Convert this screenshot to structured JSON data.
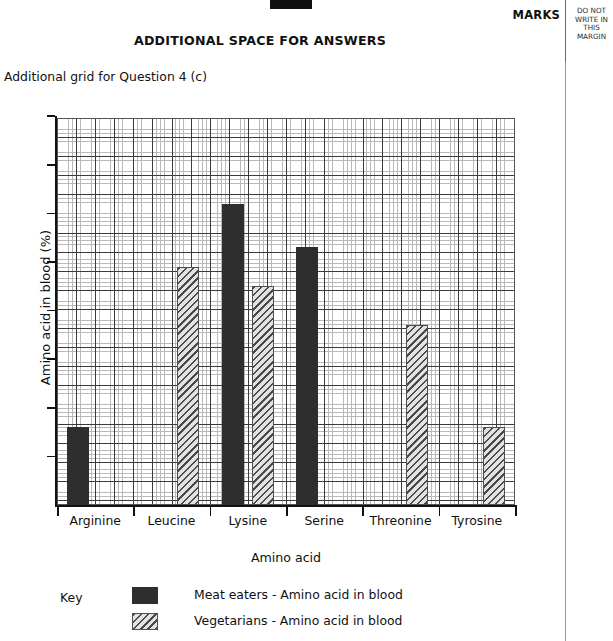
{
  "page": {
    "marks_label": "MARKS",
    "margin_note_lines": [
      "DO NOT",
      "WRITE IN",
      "THIS",
      "MARGIN"
    ],
    "title": "ADDITIONAL SPACE FOR ANSWERS",
    "subtitle": "Additional grid for Question 4 (c)"
  },
  "key": {
    "title": "Key",
    "entries": [
      {
        "label": "Meat eaters - Amino acid in blood",
        "style": "solid"
      },
      {
        "label": "Vegetarians - Amino acid in blood",
        "style": "hatch"
      }
    ]
  },
  "chart_data": {
    "type": "bar",
    "title": "",
    "xlabel": "Amino acid",
    "ylabel": "Amino acid in blood (%)",
    "grid": true,
    "grid_style": "graph-paper, major gridline every 5 small squares",
    "legend_position": "below-plot",
    "axis_tick_labels_shown": false,
    "y_major_gridline_count": 8,
    "ylim": [
      0,
      8
    ],
    "categories": [
      "Arginine",
      "Leucine",
      "Lysine",
      "Serine",
      "Threonine",
      "Tyrosine"
    ],
    "series": [
      {
        "name": "Meat eaters - Amino acid in blood",
        "style": "solid",
        "color": "#2e2e2e",
        "values": [
          1.6,
          null,
          6.2,
          5.3,
          null,
          null
        ]
      },
      {
        "name": "Vegetarians - Amino acid in blood",
        "style": "hatch",
        "color": "#4a4a4a",
        "values": [
          null,
          4.9,
          4.5,
          null,
          3.7,
          1.6
        ]
      }
    ],
    "bars": [
      {
        "category": "Arginine",
        "series": "Meat eaters - Amino acid in blood",
        "value": 1.6
      },
      {
        "category": "Leucine",
        "series": "Vegetarians - Amino acid in blood",
        "value": 4.9
      },
      {
        "category": "Lysine",
        "series": "Meat eaters - Amino acid in blood",
        "value": 6.2
      },
      {
        "category": "Lysine",
        "series": "Vegetarians - Amino acid in blood",
        "value": 4.5
      },
      {
        "category": "Serine",
        "series": "Meat eaters - Amino acid in blood",
        "value": 5.3
      },
      {
        "category": "Threonine",
        "series": "Vegetarians - Amino acid in blood",
        "value": 3.7
      },
      {
        "category": "Tyrosine",
        "series": "Vegetarians - Amino acid in blood",
        "value": 1.6
      }
    ]
  },
  "colors": {
    "ink": "#111111",
    "grid_fine": "#b9b9b9",
    "grid_major": "#3a3a3a",
    "bar_solid": "#2e2e2e",
    "bar_hatch": "#4a4a4a"
  }
}
